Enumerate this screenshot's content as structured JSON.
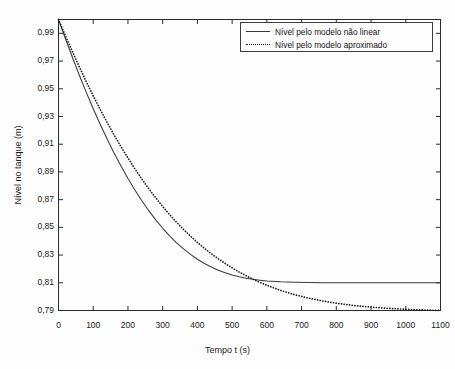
{
  "chart_data": {
    "type": "line",
    "title": "",
    "xlabel": "Tempo t (s)",
    "ylabel": "Nível no tanque (m)",
    "xlim": [
      0,
      1100
    ],
    "ylim": [
      0.79,
      1.0
    ],
    "xticks": [
      0,
      100,
      200,
      300,
      400,
      500,
      600,
      700,
      800,
      900,
      1000,
      1100
    ],
    "xtick_labels": [
      "0",
      "100",
      "200",
      "300",
      "400",
      "500",
      "600",
      "700",
      "800",
      "900",
      "1000",
      "1100"
    ],
    "yticks": [
      0.79,
      0.81,
      0.83,
      0.85,
      0.87,
      0.89,
      0.91,
      0.93,
      0.95,
      0.97,
      0.99
    ],
    "ytick_labels": [
      "0,79",
      "0,81",
      "0,83",
      "0,85",
      "0,87",
      "0,89",
      "0,91",
      "0,93",
      "0,95",
      "0,97",
      "0,99"
    ],
    "grid": false,
    "legend_position": "upper right",
    "series": [
      {
        "name": "Nível pelo modelo não linear",
        "style": "solid",
        "color": "#3a3a3a",
        "x": [
          0,
          20,
          40,
          60,
          80,
          100,
          120,
          140,
          160,
          180,
          200,
          220,
          240,
          260,
          280,
          300,
          320,
          340,
          360,
          380,
          400,
          420,
          440,
          460,
          480,
          500,
          520,
          540,
          560,
          580,
          600,
          640,
          680,
          720,
          760,
          800,
          840,
          880,
          920,
          960,
          1000,
          1040,
          1080,
          1100
        ],
        "y": [
          0.998,
          0.9825,
          0.9675,
          0.953,
          0.9392,
          0.926,
          0.9135,
          0.9016,
          0.8903,
          0.8797,
          0.8697,
          0.8604,
          0.8517,
          0.8437,
          0.8363,
          0.8295,
          0.8234,
          0.8178,
          0.8128,
          0.8084,
          0.8045,
          0.8011,
          0.7982,
          0.7957,
          0.7936,
          0.7918,
          0.7904,
          0.7892,
          0.7883,
          0.7876,
          0.787,
          0.7863,
          0.7859,
          0.7857,
          0.7856,
          0.7855,
          0.7855,
          0.7855,
          0.7855,
          0.7855,
          0.7855,
          0.7855,
          0.7855,
          0.7855
        ]
      },
      {
        "name": "Nível pelo modelo aproximado",
        "style": "dotted",
        "color": "#1a1a1a",
        "x": [
          0,
          20,
          40,
          60,
          80,
          100,
          120,
          140,
          160,
          180,
          200,
          220,
          240,
          260,
          280,
          300,
          320,
          340,
          360,
          380,
          400,
          420,
          440,
          460,
          480,
          500,
          520,
          540,
          560,
          580,
          600,
          640,
          680,
          720,
          760,
          800,
          840,
          880,
          920,
          960,
          1000,
          1040,
          1080,
          1100
        ],
        "y": [
          0.998,
          0.9822,
          0.9668,
          0.9519,
          0.9376,
          0.9238,
          0.9106,
          0.8979,
          0.8858,
          0.8743,
          0.8633,
          0.8528,
          0.8429,
          0.8335,
          0.8246,
          0.8162,
          0.8083,
          0.8009,
          0.7939,
          0.7874,
          0.7813,
          0.7756,
          0.7703,
          0.7654,
          0.7608,
          0.7565,
          0.7526,
          0.7489,
          0.7455,
          0.7424,
          0.7396,
          0.7346,
          0.7305,
          0.7271,
          0.7244,
          0.7222,
          0.7204,
          0.719,
          0.7179,
          0.717,
          0.7163,
          0.7157,
          0.7153,
          0.7151
        ]
      }
    ],
    "series_settle_values": [
      0.81,
      0.79
    ],
    "series_start_value": 1.0
  },
  "legend": {
    "entries": [
      {
        "label": "Nível pelo modelo não linear",
        "style": "solid"
      },
      {
        "label": "Nível pelo modelo aproximado",
        "style": "dotted"
      }
    ]
  },
  "axes": {
    "x_title": "Tempo t (s)",
    "y_title": "Nível no tanque (m)"
  }
}
